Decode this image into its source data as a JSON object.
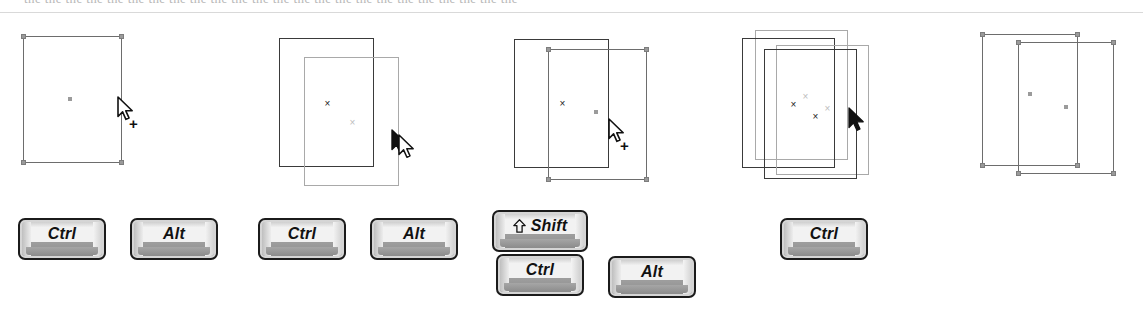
{
  "page": {
    "top_ghost_text": "the the the the the the the the the the the the the the the the the the the the the the the the",
    "background_color": "#ffffff",
    "dark_stroke": "#3a3a3a",
    "light_stroke": "#a9a9a9",
    "handle_color": "#9a9a9a"
  },
  "figures": [
    {
      "id": "step-1",
      "name": "single-selected-rectangle-with-copy-cursor",
      "rectangles": [
        {
          "style": "handled",
          "x": 23,
          "y": 36,
          "w": 99,
          "h": 127,
          "handles": true,
          "marker": "dot",
          "marker_x": 68,
          "marker_y": 97
        }
      ],
      "cursor": {
        "type": "arrow-plus",
        "x": 117,
        "y": 96
      }
    },
    {
      "id": "step-2",
      "name": "original-and-dragged-copy-outline",
      "rectangles": [
        {
          "style": "dark",
          "x": 279,
          "y": 38,
          "w": 95,
          "h": 129,
          "handles": false,
          "marker": "x-dark",
          "marker_x": 323,
          "marker_y": 99
        },
        {
          "style": "light",
          "x": 304,
          "y": 57,
          "w": 95,
          "h": 129,
          "handles": false,
          "marker": "x-light",
          "marker_x": 348,
          "marker_y": 118
        }
      ],
      "cursor": {
        "type": "arrow-move",
        "x": 391,
        "y": 129
      }
    },
    {
      "id": "step-3",
      "name": "copy-placed-and-selected",
      "rectangles": [
        {
          "style": "dark",
          "x": 514,
          "y": 39,
          "w": 95,
          "h": 129,
          "handles": false,
          "marker": "x-dark",
          "marker_x": 558,
          "marker_y": 99
        },
        {
          "style": "handled",
          "x": 548,
          "y": 49,
          "w": 99,
          "h": 131,
          "handles": true,
          "marker": "dot",
          "marker_x": 594,
          "marker_y": 110
        }
      ],
      "cursor": {
        "type": "arrow-plus",
        "x": 608,
        "y": 118
      }
    },
    {
      "id": "step-4",
      "name": "multiple-copies-stacked",
      "rectangles": [
        {
          "style": "light",
          "x": 755,
          "y": 30,
          "w": 93,
          "h": 130,
          "handles": false,
          "marker": "x-light",
          "marker_x": 801,
          "marker_y": 92
        },
        {
          "style": "dark",
          "x": 742,
          "y": 38,
          "w": 93,
          "h": 130,
          "handles": false,
          "marker": "x-dark",
          "marker_x": 789,
          "marker_y": 100
        },
        {
          "style": "light",
          "x": 776,
          "y": 45,
          "w": 93,
          "h": 130,
          "handles": false,
          "marker": "x-light",
          "marker_x": 823,
          "marker_y": 104
        },
        {
          "style": "dark",
          "x": 764,
          "y": 49,
          "w": 93,
          "h": 130,
          "handles": false,
          "marker": "x-dark",
          "marker_x": 811,
          "marker_y": 112
        }
      ],
      "cursor": {
        "type": "arrow-solid",
        "x": 848,
        "y": 107
      }
    },
    {
      "id": "step-5",
      "name": "two-selected-rectangles-no-cursor",
      "rectangles": [
        {
          "style": "handled",
          "x": 982,
          "y": 34,
          "w": 96,
          "h": 132,
          "handles": true,
          "marker": "dot",
          "marker_x": 1028,
          "marker_y": 92
        },
        {
          "style": "handled",
          "x": 1018,
          "y": 42,
          "w": 96,
          "h": 132,
          "handles": true,
          "marker": "dot",
          "marker_x": 1064,
          "marker_y": 105
        }
      ],
      "cursor": null
    }
  ],
  "keys": [
    {
      "label": "Ctrl",
      "icon": null,
      "x": 18,
      "y": 218,
      "w": 88,
      "h": 42,
      "font_size": 16
    },
    {
      "label": "Alt",
      "icon": null,
      "x": 130,
      "y": 218,
      "w": 88,
      "h": 42,
      "font_size": 16
    },
    {
      "label": "Ctrl",
      "icon": null,
      "x": 258,
      "y": 218,
      "w": 88,
      "h": 42,
      "font_size": 16
    },
    {
      "label": "Alt",
      "icon": null,
      "x": 370,
      "y": 218,
      "w": 88,
      "h": 42,
      "font_size": 16
    },
    {
      "label": "Shift",
      "icon": "shift-up-arrow-icon",
      "x": 492,
      "y": 210,
      "w": 96,
      "h": 42,
      "font_size": 16
    },
    {
      "label": "Ctrl",
      "icon": null,
      "x": 496,
      "y": 254,
      "w": 88,
      "h": 42,
      "font_size": 16
    },
    {
      "label": "Alt",
      "icon": null,
      "x": 608,
      "y": 256,
      "w": 88,
      "h": 42,
      "font_size": 16
    },
    {
      "label": "Ctrl",
      "icon": null,
      "x": 780,
      "y": 218,
      "w": 88,
      "h": 42,
      "font_size": 16
    }
  ]
}
